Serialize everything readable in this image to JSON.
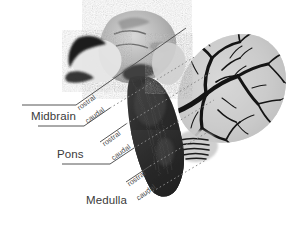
{
  "figure": {
    "background_color": "#ffffff",
    "width": 289,
    "height": 225
  },
  "specimen": {
    "name": "brainstem-cerebellum-photograph",
    "parts": [
      {
        "name": "midbrain-thalamus",
        "tone": "#b9b9b9"
      },
      {
        "name": "pons",
        "tone": "#2e2e2e"
      },
      {
        "name": "medulla",
        "tone": "#262626"
      },
      {
        "name": "cerebellum",
        "tone": "#c9c9c9"
      },
      {
        "name": "cerebellum-arbor-vitae",
        "tone": "#1a1a1a"
      }
    ]
  },
  "regions": [
    {
      "label": "Midbrain",
      "rostral": "rostral",
      "caudal": "caudal"
    },
    {
      "label": "Pons",
      "rostral": "rostral",
      "caudal": "caudal"
    },
    {
      "label": "Medulla",
      "rostral": "rostral",
      "caudal": "caudal"
    }
  ],
  "leaders": {
    "solid_color": "#555555",
    "dotted_color": "#8a8a8a"
  }
}
